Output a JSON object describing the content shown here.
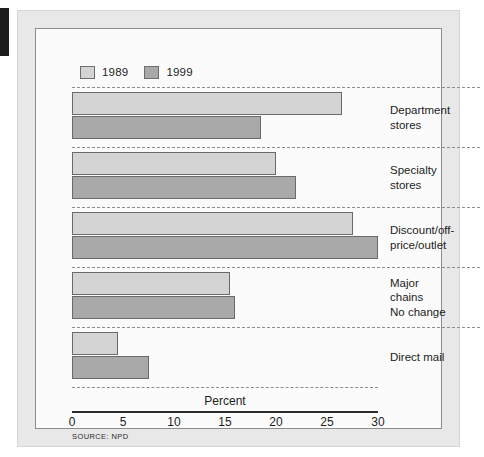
{
  "figure": {
    "source_note": "SOURCE: NPD",
    "colors": {
      "series_1989": "#d4d4d4",
      "series_1999": "#a9a9a9",
      "bar_outline": "#6a6a6a",
      "frame": "#e8e8e8",
      "plot_background": "#fbfbfb",
      "axis_line": "#2b2b2b",
      "separator": "#8e8e8e"
    }
  },
  "chart_data": {
    "type": "bar",
    "orientation": "horizontal",
    "title": "",
    "subtitle": "",
    "xlabel": "Percent",
    "ylabel": "",
    "xlim": [
      0,
      30
    ],
    "xticks": [
      0,
      5,
      10,
      15,
      20,
      25,
      30
    ],
    "xtick_labels": [
      "0",
      "5",
      "10",
      "15",
      "20",
      "25",
      "30"
    ],
    "grid": false,
    "legend_position": "top-left",
    "categories": [
      "Department stores",
      "Specialty stores",
      "Discount/off-price/outlet",
      "Major chains No change",
      "Direct mail"
    ],
    "category_lines": [
      [
        "Department",
        "stores"
      ],
      [
        "Specialty",
        "stores"
      ],
      [
        "Discount/off-",
        "price/outlet"
      ],
      [
        "Major",
        "chains",
        "No change"
      ],
      [
        "Direct mail"
      ]
    ],
    "series": [
      {
        "name": "1989",
        "color": "#d4d4d4",
        "values": [
          26.5,
          20.0,
          27.5,
          15.5,
          4.5
        ]
      },
      {
        "name": "1999",
        "color": "#a9a9a9",
        "values": [
          18.5,
          22.0,
          30.0,
          16.0,
          7.5
        ]
      }
    ],
    "annotations": [
      "SOURCE: NPD"
    ]
  }
}
